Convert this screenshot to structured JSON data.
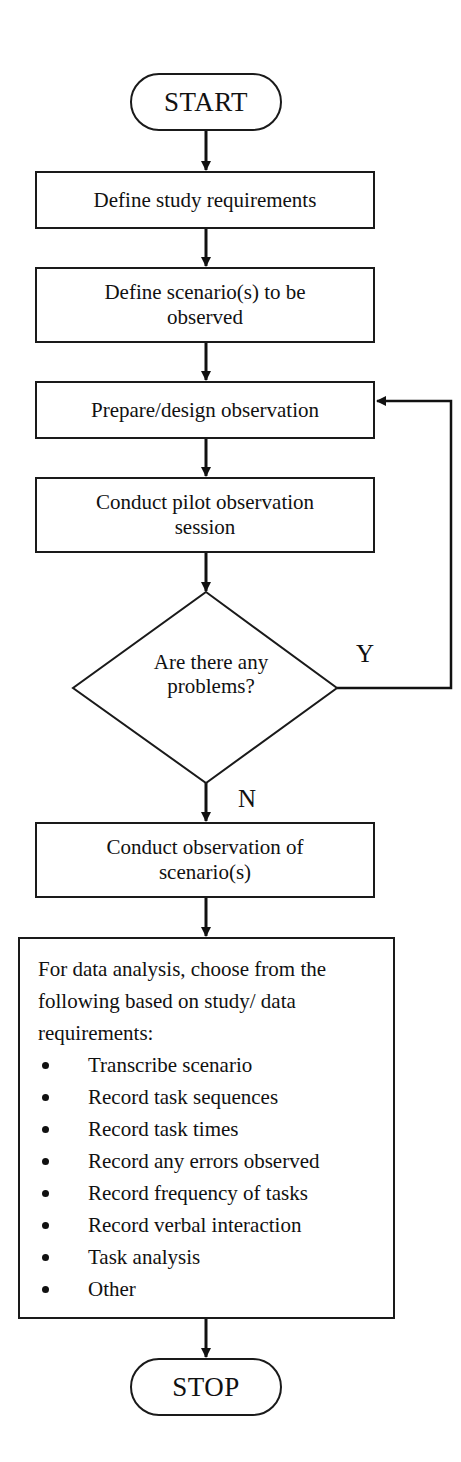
{
  "flowchart": {
    "start": "START",
    "stop": "STOP",
    "steps": [
      "Define study requirements",
      "Define scenario(s) to be observed",
      "Prepare/design observation",
      "Conduct pilot observation session"
    ],
    "decision": {
      "question": "Are there any problems?",
      "yes_label": "Y",
      "no_label": "N"
    },
    "conduct_step": "Conduct observation of scenario(s)",
    "analysis": {
      "intro": "For data analysis, choose from the following based on study/ data requirements:",
      "items": [
        "Transcribe scenario",
        "Record task sequences",
        "Record task times",
        "Record any errors observed",
        "Record frequency of tasks",
        "Record verbal interaction",
        "Task analysis",
        "Other"
      ]
    },
    "colors": {
      "stroke": "#1a1a1a",
      "background": "#ffffff"
    }
  }
}
